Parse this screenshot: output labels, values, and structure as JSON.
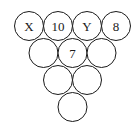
{
  "diagram": {
    "stroke_color": "#1a1a1a",
    "radius": 14.5,
    "circles": [
      {
        "row": 1,
        "col": 1,
        "cx": 29,
        "cy": 26,
        "label": "X"
      },
      {
        "row": 1,
        "col": 2,
        "cx": 58,
        "cy": 26,
        "label": "10"
      },
      {
        "row": 1,
        "col": 3,
        "cx": 87,
        "cy": 26,
        "label": "Y"
      },
      {
        "row": 1,
        "col": 4,
        "cx": 116,
        "cy": 26,
        "label": "8"
      },
      {
        "row": 2,
        "col": 1,
        "cx": 43.5,
        "cy": 53,
        "label": ""
      },
      {
        "row": 2,
        "col": 2,
        "cx": 72.5,
        "cy": 53,
        "label": "7"
      },
      {
        "row": 2,
        "col": 3,
        "cx": 101.5,
        "cy": 53,
        "label": ""
      },
      {
        "row": 3,
        "col": 1,
        "cx": 58,
        "cy": 80,
        "label": ""
      },
      {
        "row": 3,
        "col": 2,
        "cx": 87,
        "cy": 80,
        "label": ""
      },
      {
        "row": 4,
        "col": 1,
        "cx": 72.5,
        "cy": 107,
        "label": ""
      }
    ]
  }
}
